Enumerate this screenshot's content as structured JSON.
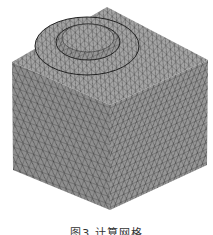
{
  "figure": {
    "label": "图3",
    "title": "计算网格",
    "caption": "图3  计算网格"
  },
  "colors": {
    "mesh_fill": "#8e8e8e",
    "mesh_line": "#2a2a2a",
    "background": "#ffffff"
  }
}
